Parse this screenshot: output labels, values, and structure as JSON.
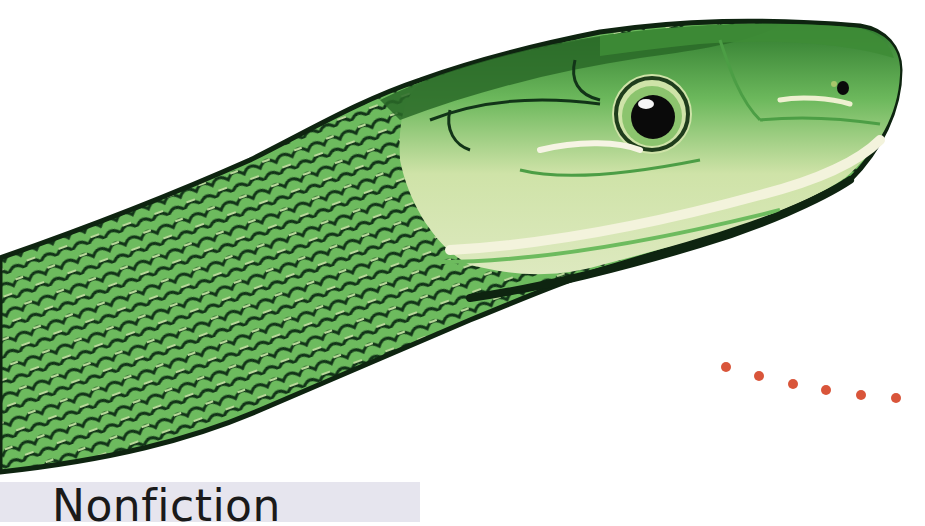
{
  "image": {
    "subject": "green snake head (green mamba) in profile facing right",
    "background_color": "#ffffff",
    "colors": {
      "scale_green": "#6dbb5e",
      "dark_outline": "#0e2410",
      "mid_green": "#4c9e45",
      "pale_belly": "#d9e7b8",
      "cream_highlight": "#eef0d0",
      "eye_black": "#0a0a0a",
      "dot_red": "#d9553a",
      "label_bg": "#e6e5ee",
      "label_text": "#1a1a1a"
    }
  },
  "label": {
    "text": "Nonfiction"
  },
  "dots": {
    "count": 6,
    "positions": [
      [
        726,
        367
      ],
      [
        759,
        376
      ],
      [
        793,
        384
      ],
      [
        826,
        390
      ],
      [
        861,
        395
      ],
      [
        896,
        398
      ]
    ]
  }
}
